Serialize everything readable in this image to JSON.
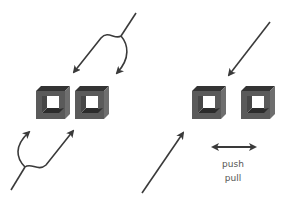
{
  "diagram": {
    "colors": {
      "arrow": "#3a3a3a",
      "frame_front": "#5a5a5a",
      "frame_top": "#333333",
      "frame_side": "#6e6e6e",
      "frame_bottom_inner": "#2b2b2b",
      "text": "#555555"
    },
    "left_panel": {
      "boxes": [
        "box-1",
        "box-2"
      ],
      "arrows": [
        "split-arrow-top-down",
        "split-arrow-bottom-up"
      ]
    },
    "right_panel": {
      "boxes": [
        "box-1",
        "box-2"
      ],
      "arrows": [
        "arrow-top-down",
        "arrow-bottom-up",
        "double-arrow-horizontal"
      ],
      "labels": {
        "push": "push",
        "pull": "pull"
      }
    }
  }
}
